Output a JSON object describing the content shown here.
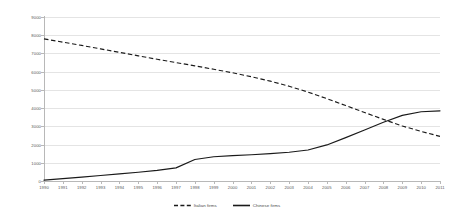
{
  "chart_data": {
    "type": "line",
    "title": "",
    "subtitle": "",
    "xlabel": "",
    "ylabel": "",
    "grid": true,
    "legend_position": "bottom-center",
    "ylim": [
      0,
      9000
    ],
    "ytick_step": 1000,
    "yticks": [
      "0",
      "1000",
      "2000",
      "3000",
      "4000",
      "5000",
      "6000",
      "7000",
      "8000",
      "9000"
    ],
    "categories": [
      "1990",
      "1991",
      "1992",
      "1993",
      "1994",
      "1995",
      "1996",
      "1997",
      "1998",
      "1999",
      "2000",
      "2001",
      "2002",
      "2003",
      "2004",
      "2005",
      "2006",
      "2007",
      "2008",
      "2009",
      "2010",
      "2011"
    ],
    "series": [
      {
        "name": "Italian firms",
        "style": "dashed",
        "color": "#1a1a1a",
        "values": [
          7800,
          7620,
          7440,
          7250,
          7060,
          6870,
          6680,
          6500,
          6320,
          6130,
          5940,
          5720,
          5480,
          5200,
          4880,
          4520,
          4140,
          3760,
          3380,
          3020,
          2720,
          2450
        ]
      },
      {
        "name": "Chinese firms",
        "style": "solid",
        "color": "#1a1a1a",
        "values": [
          50,
          130,
          215,
          300,
          390,
          480,
          580,
          720,
          1180,
          1330,
          1390,
          1440,
          1500,
          1580,
          1700,
          1980,
          2380,
          2800,
          3220,
          3600,
          3800,
          3850
        ]
      }
    ]
  },
  "legend": {
    "items": [
      {
        "label": "Italian firms",
        "style": "dashed"
      },
      {
        "label": "Chinese firms",
        "style": "solid"
      }
    ]
  }
}
